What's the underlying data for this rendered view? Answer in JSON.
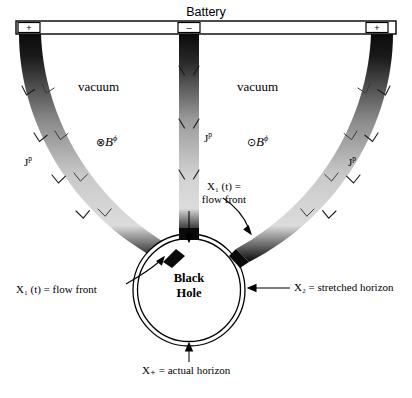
{
  "figure": {
    "title": "Battery",
    "terminals": [
      {
        "id": "left",
        "sign": "+"
      },
      {
        "id": "center",
        "sign": "–"
      },
      {
        "id": "right",
        "sign": "+"
      }
    ],
    "regions": [
      {
        "id": "left-vacuum",
        "label": "vacuum"
      },
      {
        "id": "right-vacuum",
        "label": "vacuum"
      }
    ],
    "bfields": [
      {
        "id": "b-into-page",
        "symbol": "⊗",
        "base": "B",
        "exponent": "ϕ"
      },
      {
        "id": "b-out-of-page",
        "symbol": "⊙",
        "base": "B",
        "exponent": "ϕ"
      }
    ],
    "currents": [
      {
        "id": "left-arm",
        "base": "J",
        "exponent": "p"
      },
      {
        "id": "center-arm",
        "base": "J",
        "exponent": "p"
      },
      {
        "id": "right-arm",
        "base": "J",
        "exponent": "p"
      }
    ],
    "black_hole": {
      "line1": "Black",
      "line2": "Hole"
    },
    "annotations": [
      {
        "id": "flow-front-top",
        "line1": "X₁ (t) =",
        "line2": "flow front"
      },
      {
        "id": "flow-front-left",
        "text": "X₁ (t) = flow front"
      },
      {
        "id": "stretched-horizon",
        "text": "X₂ = stretched horizon"
      },
      {
        "id": "actual-horizon",
        "text": "X₊ = actual horizon"
      }
    ],
    "colors": {
      "ink": "#000000",
      "current_dark": "#101010",
      "current_light": "#d7d7d7",
      "caption_gray": "#6d6d6d"
    }
  }
}
